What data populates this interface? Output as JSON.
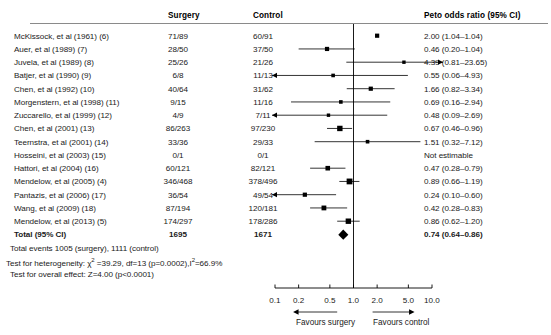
{
  "figure": {
    "type": "forest-plot",
    "title": "",
    "columns": {
      "study": "",
      "surgery": "Surgery",
      "control": "Control",
      "effect": "Peto odds ratio (95% CI)"
    }
  },
  "rows": [
    {
      "study": "McKissock, et al (1961) (6)",
      "surgery": "71/89",
      "control": "60/91",
      "stat": "2.00 (1.04–1.04)",
      "or": 2.0,
      "lo": 1.04,
      "hi": 1.04,
      "clipLo": false,
      "clipHi": false,
      "w": 4.2
    },
    {
      "study": "Auer, et al (1989) (7)",
      "surgery": "28/50",
      "control": "37/50",
      "stat": "0.46 (0.20–1.04)",
      "or": 0.46,
      "lo": 0.2,
      "hi": 1.04,
      "clipLo": false,
      "clipHi": false,
      "w": 4.2
    },
    {
      "study": "Juvela, et al (1989) (8)",
      "surgery": "25/26",
      "control": "21/26",
      "stat": "4.39 (0.81–23.65)",
      "or": 4.39,
      "lo": 0.81,
      "hi": 23.65,
      "clipLo": false,
      "clipHi": true,
      "w": 3.4
    },
    {
      "study": "Batjer, et al (1990) (9)",
      "surgery": "6/8",
      "control": "11/13",
      "stat": "0.55 (0.06–4.93)",
      "or": 0.55,
      "lo": 0.06,
      "hi": 4.93,
      "clipLo": true,
      "clipHi": false,
      "w": 3.6
    },
    {
      "study": "Chen, et al (1992) (10)",
      "surgery": "40/64",
      "control": "31/62",
      "stat": "1.66 (0.82–3.34)",
      "or": 1.66,
      "lo": 0.82,
      "hi": 3.34,
      "clipLo": false,
      "clipHi": false,
      "w": 4.2
    },
    {
      "study": "Morgenstern, et al (1998) (11)",
      "surgery": "9/15",
      "control": "11/16",
      "stat": "0.69 (0.16–2.94)",
      "or": 0.69,
      "lo": 0.16,
      "hi": 2.94,
      "clipLo": false,
      "clipHi": false,
      "w": 3.6
    },
    {
      "study": "Zuccarello, et al (1999) (12)",
      "surgery": "4/9",
      "control": "7/11",
      "stat": "0.48 (0.09–2.69)",
      "or": 0.48,
      "lo": 0.09,
      "hi": 2.69,
      "clipLo": true,
      "clipHi": false,
      "w": 3.4
    },
    {
      "study": "Chen, et al (2001) (13)",
      "surgery": "86/263",
      "control": "97/230",
      "stat": "0.67 (0.46–0.96)",
      "or": 0.67,
      "lo": 0.46,
      "hi": 0.96,
      "clipLo": false,
      "clipHi": false,
      "w": 5.4
    },
    {
      "study": "Teernstra, et al (2001) (14)",
      "surgery": "33/36",
      "control": "29/33",
      "stat": "1.51 (0.32–7.12)",
      "or": 1.51,
      "lo": 0.32,
      "hi": 7.12,
      "clipLo": false,
      "clipHi": false,
      "w": 3.6
    },
    {
      "study": "Hosseini, et al (2003) (15)",
      "surgery": "0/1",
      "control": "0/1",
      "stat": "Not estimable",
      "or": null,
      "lo": null,
      "hi": null,
      "clipLo": false,
      "clipHi": false,
      "w": 0
    },
    {
      "study": "Hattori, et al (2004) (16)",
      "surgery": "60/121",
      "control": "82/121",
      "stat": "0.47 (0.28–0.79)",
      "or": 0.47,
      "lo": 0.28,
      "hi": 0.79,
      "clipLo": false,
      "clipHi": false,
      "w": 4.6
    },
    {
      "study": "Mendelow, et al (2005) (4)",
      "surgery": "346/468",
      "control": "378/496",
      "stat": "0.89 (0.66–1.19)",
      "or": 0.89,
      "lo": 0.66,
      "hi": 1.19,
      "clipLo": false,
      "clipHi": false,
      "w": 5.8
    },
    {
      "study": "Pantazis, et al (2006) (17)",
      "surgery": "36/54",
      "control": "49/54",
      "stat": "0.24 (0.10–0.60)",
      "or": 0.24,
      "lo": 0.1,
      "hi": 0.6,
      "clipLo": true,
      "clipHi": false,
      "w": 4.2
    },
    {
      "study": "Wang, et al (2009) (18)",
      "surgery": "87/194",
      "control": "120/181",
      "stat": "0.42 (0.28–0.83)",
      "or": 0.42,
      "lo": 0.28,
      "hi": 0.83,
      "clipLo": false,
      "clipHi": false,
      "w": 4.8
    },
    {
      "study": "Mendelow, et al (2013) (5)",
      "surgery": "174/297",
      "control": "178/286",
      "stat": "0.86 (0.62–1.20)",
      "or": 0.86,
      "lo": 0.62,
      "hi": 1.2,
      "clipLo": false,
      "clipHi": false,
      "w": 5.4
    }
  ],
  "total": {
    "label": "Total (95% CI)",
    "surgery": "1695",
    "control": "1671",
    "stat": "0.74 (0.64–0.86)",
    "or": 0.74,
    "lo": 0.64,
    "hi": 0.86
  },
  "footer": {
    "total_events": "Total events 1005 (surgery), 1111 (control)",
    "heterogeneity_pre": "Test for heterogeneity: χ",
    "heterogeneity_sup1": "2",
    "heterogeneity_mid": " =39.29, df=13 (p=0.0002),I",
    "heterogeneity_sup2": "2",
    "heterogeneity_post": "=66.9%",
    "overall_effect": "Test for overall effect: Z=4.00 (p<0.0001)"
  },
  "axis": {
    "ticks": [
      0.1,
      0.2,
      0.5,
      1.0,
      2.0,
      5.0,
      10.0
    ],
    "tick_labels": [
      "0.1",
      "0.2",
      "0.5",
      "1.0",
      "2.0",
      "5.0",
      "10.0"
    ],
    "min": 0.1,
    "max": 10.0,
    "scale": "log",
    "left_caption": "Favours surgery",
    "right_caption": "Favours control",
    "null_value": 1.0
  },
  "chart_data": {
    "type": "forest",
    "title": "",
    "xlabel": "Peto odds ratio (95% CI)",
    "ylabel": "",
    "xlim": [
      0.1,
      10.0
    ],
    "xscale": "log",
    "categories": [
      "McKissock, et al (1961) (6)",
      "Auer, et al (1989) (7)",
      "Juvela, et al (1989) (8)",
      "Batjer, et al (1990) (9)",
      "Chen, et al (1992) (10)",
      "Morgenstern, et al (1998) (11)",
      "Zuccarello, et al (1999) (12)",
      "Chen, et al (2001) (13)",
      "Teernstra, et al (2001) (14)",
      "Hosseini, et al (2003) (15)",
      "Hattori, et al (2004) (16)",
      "Mendelow, et al (2005) (4)",
      "Pantazis, et al (2006) (17)",
      "Wang, et al (2009) (18)",
      "Mendelow, et al (2013) (5)",
      "Total (95% CI)"
    ],
    "values": [
      2.0,
      0.46,
      4.39,
      0.55,
      1.66,
      0.69,
      0.48,
      0.67,
      1.51,
      null,
      0.47,
      0.89,
      0.24,
      0.42,
      0.86,
      0.74
    ],
    "ci_low": [
      1.04,
      0.2,
      0.81,
      0.06,
      0.82,
      0.16,
      0.09,
      0.46,
      0.32,
      null,
      0.28,
      0.66,
      0.1,
      0.28,
      0.62,
      0.64
    ],
    "ci_high": [
      1.04,
      1.04,
      23.65,
      4.93,
      3.34,
      2.94,
      2.69,
      0.96,
      7.12,
      null,
      0.79,
      1.19,
      0.6,
      0.83,
      1.2,
      0.86
    ],
    "grid": false,
    "legend": "none"
  },
  "colors": {
    "marker": "#000000",
    "line": "#000000",
    "rule": "#8a8a8a",
    "text": "#1a1a1a"
  }
}
